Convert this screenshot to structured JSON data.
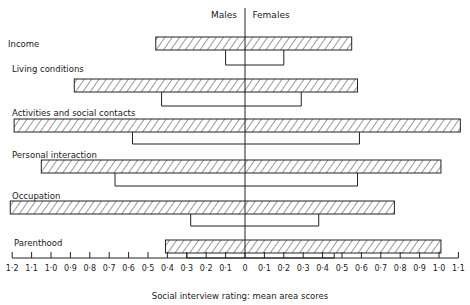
{
  "chart_data": {
    "type": "bar",
    "orientation": "horizontal-diverging",
    "title": "",
    "xlabel": "Social interview rating: mean area scores",
    "ylabel": "",
    "side_labels": {
      "left": "Males",
      "right": "Females"
    },
    "xlim": [
      -1.2,
      1.1
    ],
    "x_tick_labels": [
      "1·2",
      "1·1",
      "1·0",
      "0·9",
      "0·8",
      "0·7",
      "0·6",
      "0·5",
      "0·4",
      "0·3",
      "0·2",
      "0·1",
      "0",
      "0·1",
      "0·2",
      "0·3",
      "0·4",
      "0·5",
      "0·6",
      "0·7",
      "0·8",
      "0·9",
      "1·0",
      "1·1"
    ],
    "x_tick_values": [
      -1.2,
      -1.1,
      -1.0,
      -0.9,
      -0.8,
      -0.7,
      -0.6,
      -0.5,
      -0.4,
      -0.3,
      -0.2,
      -0.1,
      0,
      0.1,
      0.2,
      0.3,
      0.4,
      0.5,
      0.6,
      0.7,
      0.8,
      0.9,
      1.0,
      1.1
    ],
    "categories": [
      "Income",
      "Living conditions",
      "Activities and social contacts",
      "Personal interaction",
      "Occupation",
      "Parenthood"
    ],
    "series": [
      {
        "name": "Males (hatched bar)",
        "style": "hatched",
        "values": [
          0.46,
          0.88,
          1.19,
          1.05,
          1.21,
          0.41
        ]
      },
      {
        "name": "Females (hatched bar)",
        "style": "hatched",
        "values": [
          0.55,
          0.58,
          1.11,
          1.01,
          0.77,
          1.01
        ]
      },
      {
        "name": "Males (open bar)",
        "style": "open",
        "values": [
          0.1,
          0.43,
          0.58,
          0.67,
          0.28,
          0.3
        ]
      },
      {
        "name": "Females (open bar)",
        "style": "open",
        "values": [
          0.2,
          0.29,
          0.59,
          0.58,
          0.38,
          0.46
        ]
      }
    ],
    "grid": false,
    "legend": "none"
  },
  "layout": {
    "center_x": 245,
    "px_per_unit": 194,
    "axis_y": 258,
    "rows": [
      {
        "label_y": 47,
        "label_x": 8,
        "bar_top": 37,
        "open_bottom": 65
      },
      {
        "label_y": 72,
        "label_x": 12,
        "bar_top": 79,
        "open_bottom": 106
      },
      {
        "label_y": 116,
        "label_x": 12,
        "bar_top": 119,
        "open_bottom": 144
      },
      {
        "label_y": 158,
        "label_x": 12,
        "bar_top": 160,
        "open_bottom": 186
      },
      {
        "label_y": 199,
        "label_x": 12,
        "bar_top": 201,
        "open_bottom": 226
      },
      {
        "label_y": 246,
        "label_x": 14,
        "bar_top": 240,
        "open_bottom": 258
      }
    ],
    "bar_height": 13
  }
}
